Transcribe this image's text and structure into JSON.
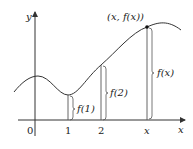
{
  "diagram": {
    "axes": {
      "y_label": "y",
      "x_label": "x",
      "origin_label": "0"
    },
    "ticks": [
      {
        "label": "1"
      },
      {
        "label": "2"
      },
      {
        "label": "x"
      }
    ],
    "point_label": "(x, f(x))",
    "heights": [
      {
        "label": "f(1)"
      },
      {
        "label": "f(2)"
      },
      {
        "label": "f(x)"
      }
    ],
    "colors": {
      "curve": "#333333",
      "axis": "#333333",
      "height_line": "#555555",
      "point": "#111111"
    }
  }
}
